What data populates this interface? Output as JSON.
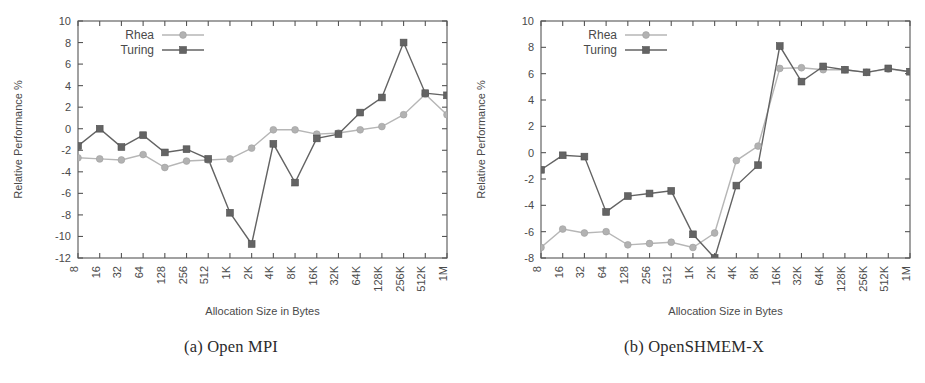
{
  "figure": {
    "panels": [
      {
        "id": "panel-a",
        "caption": "(a) Open MPI",
        "chart_ref": 0
      },
      {
        "id": "panel-b",
        "caption": "(b) OpenSHMEM-X",
        "chart_ref": 1
      }
    ]
  },
  "chart_data": [
    {
      "type": "line",
      "title": "(a) Open MPI",
      "xlabel": "Allocation Size in Bytes",
      "ylabel": "Relative Performance %",
      "categories": [
        "8",
        "16",
        "32",
        "64",
        "128",
        "256",
        "512",
        "1K",
        "2K",
        "4K",
        "8K",
        "16K",
        "32K",
        "64K",
        "128K",
        "256K",
        "512K",
        "1M"
      ],
      "ylim": [
        -12,
        10
      ],
      "yticks": [
        -12,
        -10,
        -8,
        -6,
        -4,
        -2,
        0,
        2,
        4,
        6,
        8,
        10
      ],
      "grid": false,
      "legend_position": "top-left",
      "series": [
        {
          "name": "Rhea",
          "marker": "circle",
          "color": "#b2b2b2",
          "values": [
            -2.7,
            -2.8,
            -2.9,
            -2.4,
            -3.6,
            -3.0,
            -2.9,
            -2.8,
            -1.8,
            -0.1,
            -0.1,
            -0.5,
            -0.4,
            -0.1,
            0.2,
            1.3,
            3.2,
            1.3
          ]
        },
        {
          "name": "Turing",
          "marker": "square",
          "color": "#646464",
          "values": [
            -1.6,
            0.0,
            -1.7,
            -0.6,
            -2.2,
            -1.9,
            -2.8,
            -7.8,
            -10.7,
            -1.4,
            -5.0,
            -0.9,
            -0.5,
            1.5,
            2.9,
            8.0,
            3.3,
            3.1
          ]
        }
      ]
    },
    {
      "type": "line",
      "title": "(b) OpenSHMEM-X",
      "xlabel": "Allocation Size in Bytes",
      "ylabel": "Relative Performance %",
      "categories": [
        "8",
        "16",
        "32",
        "64",
        "128",
        "256",
        "512",
        "1K",
        "2K",
        "4K",
        "8K",
        "16K",
        "32K",
        "64K",
        "128K",
        "256K",
        "512K",
        "1M"
      ],
      "ylim": [
        -8,
        10
      ],
      "yticks": [
        -8,
        -6,
        -4,
        -2,
        0,
        2,
        4,
        6,
        8,
        10
      ],
      "grid": false,
      "legend_position": "top-left",
      "series": [
        {
          "name": "Rhea",
          "marker": "circle",
          "color": "#b2b2b2",
          "values": [
            -7.2,
            -5.8,
            -6.1,
            -6.0,
            -7.0,
            -6.9,
            -6.8,
            -7.2,
            -6.1,
            -0.6,
            0.5,
            6.4,
            6.45,
            6.3,
            6.3,
            6.1,
            6.35,
            6.15
          ]
        },
        {
          "name": "Turing",
          "marker": "square",
          "color": "#646464",
          "values": [
            -1.3,
            -0.2,
            -0.3,
            -4.5,
            -3.3,
            -3.1,
            -2.9,
            -6.2,
            -8.0,
            -2.5,
            -0.95,
            8.1,
            5.4,
            6.55,
            6.3,
            6.1,
            6.4,
            6.15
          ]
        }
      ]
    }
  ]
}
